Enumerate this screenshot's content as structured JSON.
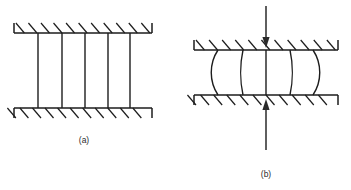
{
  "figure": {
    "background_color": "#ffffff",
    "line_color": "#1d1d1d",
    "arrow_color": "#2a2a2a",
    "panels": [
      {
        "id": "panel-a",
        "caption": "(a)",
        "caption_x": 84,
        "caption_y": 143,
        "state": "unloaded",
        "top_plate": {
          "y": 33,
          "x_start": 14,
          "x_end": 152,
          "end_cap_height": 10,
          "hatch_direction": "down-right",
          "hatch_count": 11
        },
        "bottom_plate": {
          "y": 108,
          "x_start": 14,
          "x_end": 152,
          "end_cap_height": 10,
          "hatch_direction": "down-left",
          "hatch_count": 11
        },
        "members": {
          "count": 5,
          "x_positions": [
            38,
            62,
            85,
            108,
            130
          ],
          "shape": "straight",
          "bow_offsets": [
            0,
            0,
            0,
            0,
            0
          ]
        }
      },
      {
        "id": "panel-b",
        "caption": "(b)",
        "caption_x": 266,
        "caption_y": 177,
        "state": "loaded-buckled",
        "top_plate": {
          "y": 50,
          "x_start": 194,
          "x_end": 338,
          "end_cap_height": 10,
          "hatch_direction": "down-right",
          "hatch_count": 11
        },
        "bottom_plate": {
          "y": 95,
          "x_start": 194,
          "x_end": 338,
          "end_cap_height": 10,
          "hatch_direction": "down-left",
          "hatch_count": 11
        },
        "members": {
          "count": 5,
          "x_positions": [
            218,
            243,
            266,
            290,
            313
          ],
          "shape": "buckled",
          "bow_offsets": [
            -6,
            -2,
            0,
            2,
            6
          ]
        },
        "load_arrows": [
          {
            "name": "top-compression-arrow",
            "direction": "down",
            "x": 266,
            "y_start": 6,
            "y_end": 48
          },
          {
            "name": "bottom-compression-arrow",
            "direction": "up",
            "x": 266,
            "y_start": 150,
            "y_end": 99
          }
        ]
      }
    ]
  }
}
